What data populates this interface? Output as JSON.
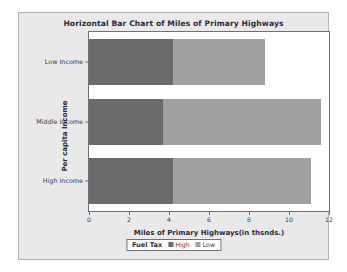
{
  "chart_data": {
    "type": "bar",
    "orientation": "horizontal",
    "stacked": true,
    "title": "Horizontal Bar Chart of Miles of Primary Highways",
    "xlabel": "Miles of Primary Highways(in thsnds.)",
    "ylabel": "Per capita Income",
    "categories": [
      "Low Income",
      "Middle Income",
      "High Income"
    ],
    "xlim": [
      0,
      12
    ],
    "xticks": [
      0,
      2,
      4,
      6,
      8,
      10,
      12
    ],
    "xtick_labels": [
      "0",
      "2",
      "4",
      "6",
      "8",
      "10",
      "12"
    ],
    "grid": false,
    "legend_position": "bottom",
    "legend_title": "Fuel Tax",
    "series": [
      {
        "name": "High",
        "color": "#6b6b6b",
        "values": [
          4.2,
          3.7,
          4.2
        ]
      },
      {
        "name": "Low",
        "color": "#a0a0a0",
        "values": [
          4.6,
          7.9,
          6.9
        ]
      }
    ],
    "totals": [
      8.8,
      11.6,
      11.1
    ]
  },
  "figure": {
    "background": "#e9e9e9",
    "plot_background": "#ffffff",
    "axis_color": "#6f6f7a"
  }
}
